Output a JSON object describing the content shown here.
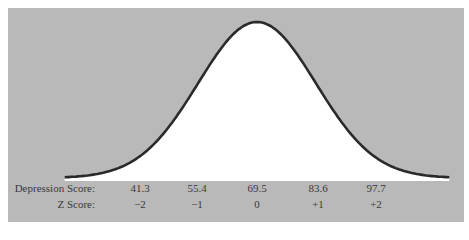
{
  "chart_data": {
    "type": "line",
    "title": "",
    "xlabel": "Depression Score",
    "ylabel": "",
    "mean": 69.5,
    "sd": 14.1,
    "x_axis_rows": [
      {
        "label": "Depression Score:",
        "ticks": [
          "41.3",
          "55.4",
          "69.5",
          "83.6",
          "97.7"
        ]
      },
      {
        "label": "Z Score:",
        "ticks": [
          "−2",
          "−1",
          "0",
          "+1",
          "+2"
        ]
      }
    ],
    "x": [
      41.3,
      55.4,
      69.5,
      83.6,
      97.7
    ],
    "z": [
      -2,
      -1,
      0,
      1,
      2
    ],
    "grid": false,
    "legend": null
  },
  "colors": {
    "background_panel": "#b9b9b9",
    "curve_fill": "#ffffff",
    "curve_stroke": "#2a2a2a",
    "text": "#3a3a3a"
  }
}
